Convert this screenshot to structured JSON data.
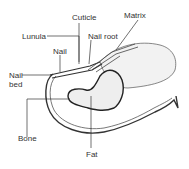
{
  "diagram": {
    "labels": {
      "cuticle": "Cuticle",
      "matrix": "Matrix",
      "lunula": "Lunula",
      "nail_root": "Nail root",
      "nail": "Nail",
      "nail_bed_line1": "Nail",
      "nail_bed_line2": "bed",
      "bone": "Bone",
      "fat": "Fat"
    },
    "colors": {
      "outline": "#333333",
      "bone_fill": "#eeeeee",
      "background": "#ffffff"
    }
  }
}
